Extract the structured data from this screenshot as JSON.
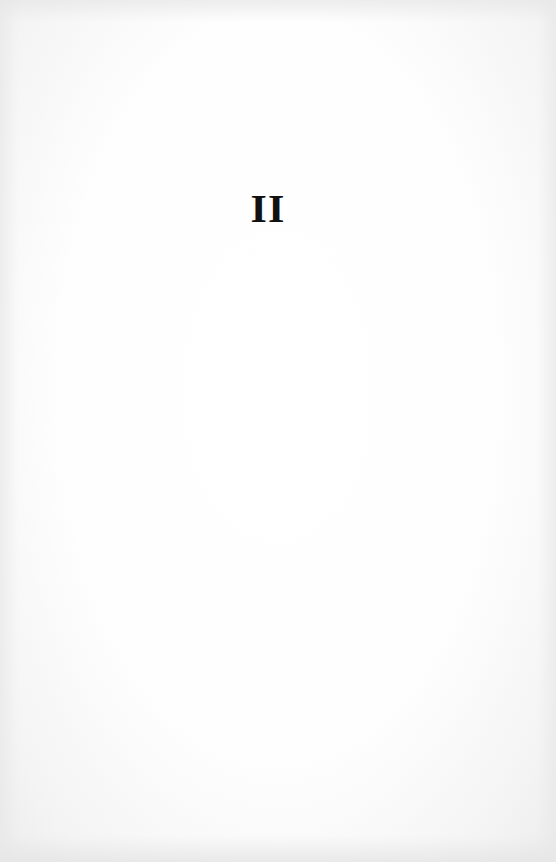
{
  "page": {
    "type": "book-part-title-page",
    "heading": "II",
    "colors": {
      "paper": "#fdfdfd",
      "ink": "#111111"
    }
  }
}
